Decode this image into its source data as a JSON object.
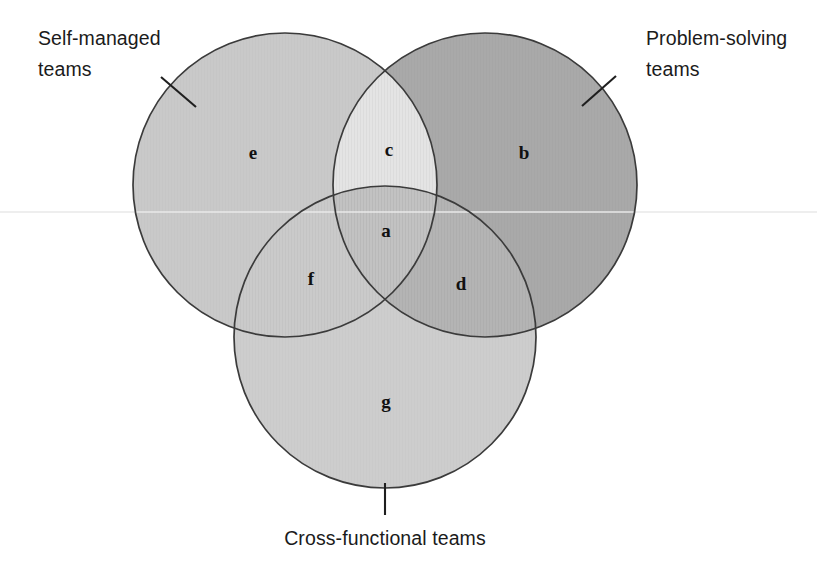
{
  "diagram": {
    "background_color": "#ffffff",
    "outline_color": "#3b3b3b",
    "label_color": "#1b1b1b",
    "letter_color": "#111111"
  },
  "callouts": [
    {
      "id": "self-managed",
      "line1": "Self-managed",
      "line2": "teams",
      "tick": "diagonal-tick"
    },
    {
      "id": "problem-solving",
      "line1": "Problem-solving",
      "line2": "teams",
      "tick": "diagonal-tick"
    },
    {
      "id": "cross-functional",
      "line1": "Cross-functional teams",
      "line2": "",
      "tick": "vertical-tick"
    }
  ],
  "circles": [
    {
      "id": "self-managed",
      "cx": 285,
      "cy": 185,
      "r": 152,
      "fill": "#c9c9c9"
    },
    {
      "id": "problem-solving",
      "cx": 485,
      "cy": 185,
      "r": 152,
      "fill": "#a9a9a9"
    },
    {
      "id": "cross-functional",
      "cx": 385,
      "cy": 337,
      "r": 151,
      "fill": "#cdcdcd"
    }
  ],
  "regions": [
    {
      "key": "e",
      "letter": "e",
      "name": "self-managed-only",
      "x": 253,
      "y": 155,
      "fill": "#c9c9c9"
    },
    {
      "key": "b",
      "letter": "b",
      "name": "problem-solving-only",
      "x": 524,
      "y": 155,
      "fill": "#a9a9a9"
    },
    {
      "key": "g",
      "letter": "g",
      "name": "cross-functional-only",
      "x": 386,
      "y": 404,
      "fill": "#cdcdcd"
    },
    {
      "key": "c",
      "letter": "c",
      "name": "self-managed-and-problem-solving",
      "x": 389,
      "y": 152,
      "fill": "#e4e4e4"
    },
    {
      "key": "f",
      "letter": "f",
      "name": "self-managed-and-cross-functional",
      "x": 311,
      "y": 281,
      "fill": "#cacaca"
    },
    {
      "key": "d",
      "letter": "d",
      "name": "problem-solving-and-cross-functional",
      "x": 461,
      "y": 286,
      "fill": "#b4b4b4"
    },
    {
      "key": "a",
      "letter": "a",
      "name": "all-three-teams",
      "x": 386,
      "y": 233,
      "fill": "#c2c2c2"
    }
  ],
  "callout_text_positions": {
    "self_managed_line1_x": 38,
    "self_managed_line1_y": 45,
    "self_managed_line2_x": 38,
    "self_managed_line2_y": 76,
    "problem_solving_line1_x": 646,
    "problem_solving_line1_y": 45,
    "problem_solving_line2_x": 646,
    "problem_solving_line2_y": 76,
    "cross_functional_x": 385,
    "cross_functional_y": 545
  },
  "ticks": {
    "self_managed": {
      "x1": 161,
      "y1": 77,
      "x2": 196,
      "y2": 107
    },
    "problem_solving": {
      "x1": 616,
      "y1": 76,
      "x2": 582,
      "y2": 106
    },
    "cross_functional": {
      "x1": 385,
      "y1": 483,
      "x2": 385,
      "y2": 515
    }
  },
  "scanline": {
    "y": 212,
    "color": "#e9e9e9"
  }
}
